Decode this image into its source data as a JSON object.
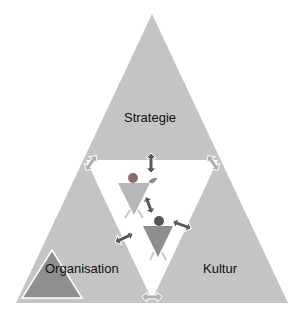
{
  "diagram": {
    "labels": {
      "top": "Strategie",
      "left": "Organisation",
      "right": "Kultur"
    },
    "colors": {
      "triangle_fill": "#c3c3c3",
      "inner_triangle_fill": "#ffffff",
      "small_triangle_fill": "#8f8f8f",
      "arrow_fill": "#5a5a5a",
      "arrow_light_fill": "#b0b0b0",
      "figure_body": "#b5b5b5",
      "figure_head": "#6a6a6a"
    }
  }
}
